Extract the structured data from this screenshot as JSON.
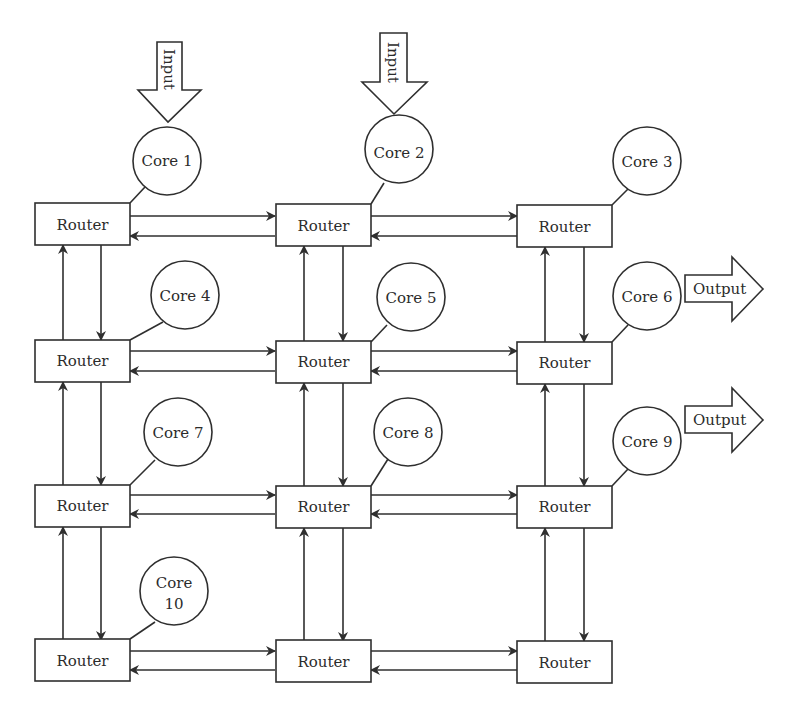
{
  "diagram": {
    "routers": {
      "label": "Router",
      "grid": {
        "rows": 4,
        "cols": 3
      },
      "items": [
        {
          "id": "r-1-1",
          "label": "Router",
          "row": 1,
          "col": 1
        },
        {
          "id": "r-1-2",
          "label": "Router",
          "row": 1,
          "col": 2
        },
        {
          "id": "r-1-3",
          "label": "Router",
          "row": 1,
          "col": 3
        },
        {
          "id": "r-2-1",
          "label": "Router",
          "row": 2,
          "col": 1
        },
        {
          "id": "r-2-2",
          "label": "Router",
          "row": 2,
          "col": 2
        },
        {
          "id": "r-2-3",
          "label": "Router",
          "row": 2,
          "col": 3
        },
        {
          "id": "r-3-1",
          "label": "Router",
          "row": 3,
          "col": 1
        },
        {
          "id": "r-3-2",
          "label": "Router",
          "row": 3,
          "col": 2
        },
        {
          "id": "r-3-3",
          "label": "Router",
          "row": 3,
          "col": 3
        },
        {
          "id": "r-4-1",
          "label": "Router",
          "row": 4,
          "col": 1
        },
        {
          "id": "r-4-2",
          "label": "Router",
          "row": 4,
          "col": 2
        },
        {
          "id": "r-4-3",
          "label": "Router",
          "row": 4,
          "col": 3
        }
      ]
    },
    "cores": [
      {
        "id": "core-1",
        "label": "Core 1",
        "router": "r-1-1",
        "input": true
      },
      {
        "id": "core-2",
        "label": "Core 2",
        "router": "r-1-2",
        "input": true
      },
      {
        "id": "core-3",
        "label": "Core 3",
        "router": "r-1-3"
      },
      {
        "id": "core-4",
        "label": "Core 4",
        "router": "r-2-1"
      },
      {
        "id": "core-5",
        "label": "Core 5",
        "router": "r-2-2"
      },
      {
        "id": "core-6",
        "label": "Core 6",
        "router": "r-2-3",
        "output": true
      },
      {
        "id": "core-7",
        "label": "Core 7",
        "router": "r-3-1"
      },
      {
        "id": "core-8",
        "label": "Core 8",
        "router": "r-3-2"
      },
      {
        "id": "core-9",
        "label": "Core 9",
        "router": "r-3-3",
        "output": true
      },
      {
        "id": "core-10",
        "label_line1": "Core",
        "label_line2": "10",
        "router": "r-4-1"
      }
    ],
    "inputs": [
      {
        "label": "Input",
        "target": "core-1"
      },
      {
        "label": "Input",
        "target": "core-2"
      }
    ],
    "outputs": [
      {
        "label": "Output",
        "source": "core-6"
      },
      {
        "label": "Output",
        "source": "core-9"
      }
    ],
    "links": {
      "horizontal": "bidirectional between adjacent routers in each row",
      "vertical": "bidirectional between adjacent routers in each column"
    },
    "colors": {
      "line": "#2f2f2f",
      "text": "#2b2b2b",
      "background": "#ffffff"
    }
  }
}
